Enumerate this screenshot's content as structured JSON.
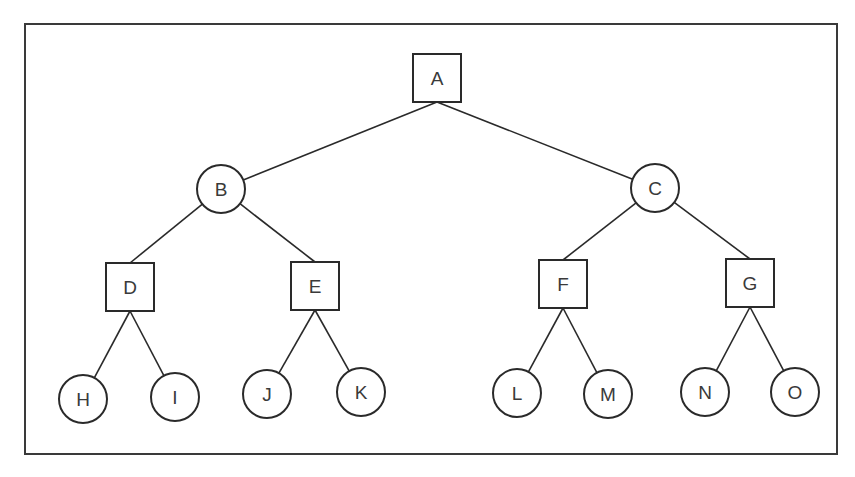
{
  "diagram": {
    "type": "game-tree",
    "frame": {
      "x": 25,
      "y": 24,
      "width": 812,
      "height": 430
    },
    "stroke_color": "#2a2a2a",
    "nodes": [
      {
        "id": "A",
        "label": "A",
        "shape": "square",
        "cx": 437,
        "cy": 78
      },
      {
        "id": "B",
        "label": "B",
        "shape": "circle",
        "cx": 221,
        "cy": 189
      },
      {
        "id": "C",
        "label": "C",
        "shape": "circle",
        "cx": 655,
        "cy": 188
      },
      {
        "id": "D",
        "label": "D",
        "shape": "square",
        "cx": 130,
        "cy": 287
      },
      {
        "id": "E",
        "label": "E",
        "shape": "square",
        "cx": 315,
        "cy": 286
      },
      {
        "id": "F",
        "label": "F",
        "shape": "square",
        "cx": 563,
        "cy": 284
      },
      {
        "id": "G",
        "label": "G",
        "shape": "square",
        "cx": 750,
        "cy": 283
      },
      {
        "id": "H",
        "label": "H",
        "shape": "circle",
        "cx": 83,
        "cy": 399
      },
      {
        "id": "I",
        "label": "I",
        "shape": "circle",
        "cx": 175,
        "cy": 397
      },
      {
        "id": "J",
        "label": "J",
        "shape": "circle",
        "cx": 267,
        "cy": 394
      },
      {
        "id": "K",
        "label": "K",
        "shape": "circle",
        "cx": 361,
        "cy": 392
      },
      {
        "id": "L",
        "label": "L",
        "shape": "circle",
        "cx": 517,
        "cy": 393
      },
      {
        "id": "M",
        "label": "M",
        "shape": "circle",
        "cx": 608,
        "cy": 394
      },
      {
        "id": "N",
        "label": "N",
        "shape": "circle",
        "cx": 705,
        "cy": 392
      },
      {
        "id": "O",
        "label": "O",
        "shape": "circle",
        "cx": 795,
        "cy": 392
      }
    ],
    "edges": [
      [
        "A",
        "B"
      ],
      [
        "A",
        "C"
      ],
      [
        "B",
        "D"
      ],
      [
        "B",
        "E"
      ],
      [
        "C",
        "F"
      ],
      [
        "C",
        "G"
      ],
      [
        "D",
        "H"
      ],
      [
        "D",
        "I"
      ],
      [
        "E",
        "J"
      ],
      [
        "E",
        "K"
      ],
      [
        "F",
        "L"
      ],
      [
        "F",
        "M"
      ],
      [
        "G",
        "N"
      ],
      [
        "G",
        "O"
      ]
    ]
  },
  "caption": {
    "text": ""
  }
}
